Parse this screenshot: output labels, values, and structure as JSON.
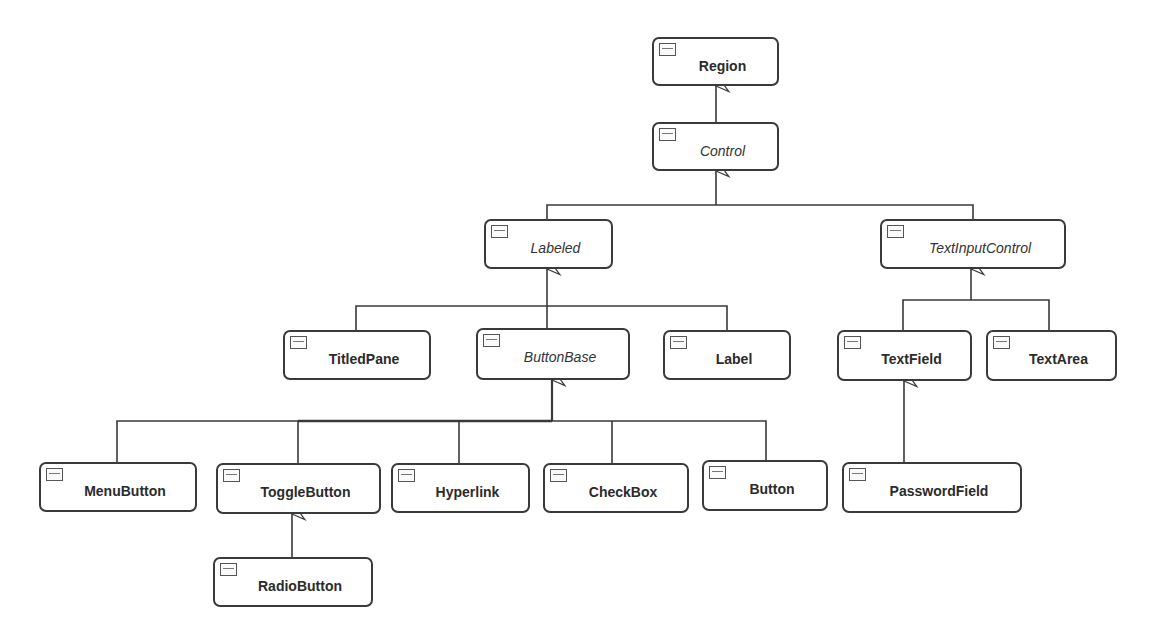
{
  "diagram": {
    "type": "UML class hierarchy",
    "classes": {
      "region": {
        "label": "Region",
        "abstract": false
      },
      "control": {
        "label": "Control",
        "abstract": true
      },
      "labeled": {
        "label": "Labeled",
        "abstract": true
      },
      "text_input_control": {
        "label": "TextInputControl",
        "abstract": true
      },
      "titled_pane": {
        "label": "TitledPane",
        "abstract": false
      },
      "button_base": {
        "label": "ButtonBase",
        "abstract": true
      },
      "label": {
        "label": "Label",
        "abstract": false
      },
      "text_field": {
        "label": "TextField",
        "abstract": false
      },
      "text_area": {
        "label": "TextArea",
        "abstract": false
      },
      "menu_button": {
        "label": "MenuButton",
        "abstract": false
      },
      "toggle_button": {
        "label": "ToggleButton",
        "abstract": false
      },
      "hyperlink": {
        "label": "Hyperlink",
        "abstract": false
      },
      "check_box": {
        "label": "CheckBox",
        "abstract": false
      },
      "button": {
        "label": "Button",
        "abstract": false
      },
      "password_field": {
        "label": "PasswordField",
        "abstract": false
      },
      "radio_button": {
        "label": "RadioButton",
        "abstract": false
      }
    },
    "inheritance": [
      {
        "child": "Control",
        "parent": "Region"
      },
      {
        "child": "Labeled",
        "parent": "Control"
      },
      {
        "child": "TextInputControl",
        "parent": "Control"
      },
      {
        "child": "TitledPane",
        "parent": "Labeled"
      },
      {
        "child": "ButtonBase",
        "parent": "Labeled"
      },
      {
        "child": "Label",
        "parent": "Labeled"
      },
      {
        "child": "TextField",
        "parent": "TextInputControl"
      },
      {
        "child": "TextArea",
        "parent": "TextInputControl"
      },
      {
        "child": "MenuButton",
        "parent": "ButtonBase"
      },
      {
        "child": "ToggleButton",
        "parent": "ButtonBase"
      },
      {
        "child": "Hyperlink",
        "parent": "ButtonBase"
      },
      {
        "child": "CheckBox",
        "parent": "ButtonBase"
      },
      {
        "child": "Button",
        "parent": "ButtonBase"
      },
      {
        "child": "PasswordField",
        "parent": "TextField"
      },
      {
        "child": "RadioButton",
        "parent": "ToggleButton"
      }
    ],
    "colors": {
      "line": "#3a3a3a",
      "box_border": "#3a3a3a",
      "text": "#2b2b2b",
      "background": "#ffffff"
    }
  }
}
